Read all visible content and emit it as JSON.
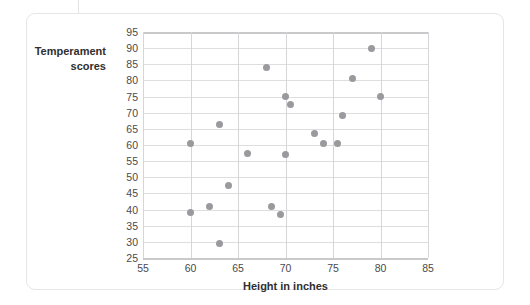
{
  "figure": {
    "y_axis_title": "Temperament scores",
    "x_axis_title": "Height in inches",
    "point_color": "#9a9a9e",
    "gridline_color": "#dededf",
    "axis_color": "#c9c9cb",
    "card_border_color": "#e6e6e8"
  },
  "chart_data": {
    "type": "scatter",
    "title": "",
    "xlabel": "Height in inches",
    "ylabel": "Temperament scores",
    "xlim": [
      55,
      85
    ],
    "ylim": [
      25,
      95
    ],
    "xticks": [
      55,
      60,
      65,
      70,
      75,
      80,
      85
    ],
    "yticks": [
      25,
      30,
      35,
      40,
      45,
      50,
      55,
      60,
      65,
      70,
      75,
      80,
      85,
      90,
      95
    ],
    "grid": true,
    "legend": null,
    "series": [
      {
        "name": "Height vs temperament",
        "marker": "circle",
        "color": "#9a9a9e",
        "points": [
          {
            "x": 60.0,
            "y": 39.0
          },
          {
            "x": 60.0,
            "y": 60.5
          },
          {
            "x": 62.0,
            "y": 41.0
          },
          {
            "x": 63.0,
            "y": 29.5
          },
          {
            "x": 63.0,
            "y": 66.5
          },
          {
            "x": 64.0,
            "y": 47.5
          },
          {
            "x": 66.0,
            "y": 57.5
          },
          {
            "x": 68.0,
            "y": 84.0
          },
          {
            "x": 68.5,
            "y": 41.0
          },
          {
            "x": 69.5,
            "y": 38.5
          },
          {
            "x": 70.0,
            "y": 75.0
          },
          {
            "x": 70.0,
            "y": 57.0
          },
          {
            "x": 70.5,
            "y": 72.5
          },
          {
            "x": 73.0,
            "y": 63.5
          },
          {
            "x": 74.0,
            "y": 60.5
          },
          {
            "x": 75.5,
            "y": 60.5
          },
          {
            "x": 76.0,
            "y": 69.0
          },
          {
            "x": 77.0,
            "y": 80.5
          },
          {
            "x": 79.0,
            "y": 90.0
          },
          {
            "x": 80.0,
            "y": 75.0
          }
        ]
      }
    ]
  }
}
